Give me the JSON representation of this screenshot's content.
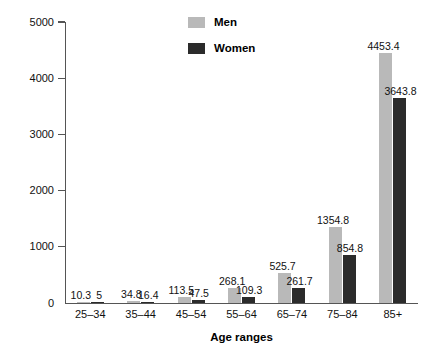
{
  "chart_data": {
    "type": "bar",
    "title": "",
    "xlabel": "Age ranges",
    "ylabel": "Deaths per 100,000 population",
    "categories": [
      "25–34",
      "35–44",
      "45–54",
      "55–64",
      "65–74",
      "75–84",
      "85+"
    ],
    "series": [
      {
        "name": "Men",
        "color": "#b9b9b9",
        "values": [
          10.3,
          34.8,
          113.5,
          268.1,
          525.7,
          1354.8,
          4453.4
        ],
        "labels": [
          "10.3",
          "34.8",
          "113.5",
          "268.1",
          "525.7",
          "1354.8",
          "4453.4"
        ]
      },
      {
        "name": "Women",
        "color": "#2b2b2b",
        "values": [
          5,
          16.4,
          47.5,
          109.3,
          261.7,
          854.8,
          3643.8
        ],
        "labels": [
          "5",
          "16.4",
          "47.5",
          "109.3",
          "261.7",
          "854.8",
          "3643.8"
        ]
      }
    ],
    "ylim": [
      0,
      5000
    ],
    "yticks": [
      0,
      1000,
      2000,
      3000,
      4000,
      5000
    ],
    "ytick_labels": [
      "0",
      "1000",
      "2000",
      "3000",
      "4000",
      "5000"
    ],
    "grid": false,
    "legend_position": "top-center"
  },
  "legend": {
    "items": [
      {
        "label": "Men",
        "color": "#b9b9b9"
      },
      {
        "label": "Women",
        "color": "#2b2b2b"
      }
    ]
  },
  "axes": {
    "y_title": "Deaths per 100,000 population",
    "x_title": "Age ranges"
  }
}
